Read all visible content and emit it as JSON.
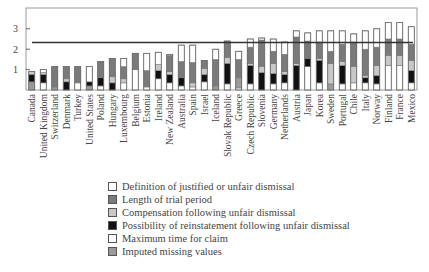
{
  "chart_data": {
    "type": "bar",
    "stacked": true,
    "title": "",
    "xlabel": "",
    "ylabel": "",
    "ylim": [
      0,
      4
    ],
    "yticks": [
      1,
      2,
      3
    ],
    "grid": false,
    "legend_position": "below",
    "reference_line": {
      "label": "OECD average",
      "value": 2.33
    },
    "categories": [
      "Canada",
      "United Kingdom",
      "Switzerland",
      "Denmark",
      "Turkey",
      "United States",
      "Poland",
      "Hungary",
      "Luxembourg",
      "Belgium",
      "Estonia",
      "Ireland",
      "New Zealand",
      "Australia",
      "Spain",
      "Israel",
      "Iceland",
      "Slovak Republic",
      "Greece",
      "Czech Republic",
      "Slovenia",
      "Germany",
      "Netherlands",
      "Austria",
      "Japan",
      "Korea",
      "Sweden",
      "Portugal",
      "Chile",
      "Italy",
      "Norway",
      "Finland",
      "France",
      "Mexico"
    ],
    "series": [
      {
        "name": "Maximum time for claim",
        "color": "#ffffff",
        "values": [
          0.0,
          0.35,
          0.0,
          0.0,
          0.35,
          0.0,
          0.2,
          0.0,
          0.35,
          1.0,
          0.15,
          0.55,
          0.35,
          0.2,
          0.15,
          0.4,
          0.0,
          0.3,
          0.1,
          0.3,
          0.0,
          0.3,
          0.35,
          0.0,
          1.15,
          0.35,
          0.0,
          0.3,
          0.35,
          0.35,
          0.3,
          1.2,
          1.2,
          0.35
        ]
      },
      {
        "name": "Imputed missing values",
        "color": "#9a9a9a",
        "values": [
          0.4,
          0.0,
          0.15,
          0.0,
          0.0,
          0.2,
          0.0,
          0.0,
          0.0,
          0.0,
          0.0,
          0.0,
          0.0,
          0.0,
          0.0,
          0.0,
          0.2,
          0.0,
          0.5,
          0.0,
          0.0,
          0.0,
          0.0,
          0.0,
          0.0,
          0.0,
          0.3,
          0.0,
          0.0,
          0.0,
          0.0,
          0.0,
          0.0,
          0.0
        ]
      },
      {
        "name": "Possibility of reinstatement following unfair dismissal",
        "color": "#111111",
        "values": [
          0.35,
          0.4,
          0.0,
          0.4,
          0.0,
          0.2,
          0.4,
          0.35,
          0.0,
          0.0,
          0.0,
          0.4,
          0.4,
          0.4,
          0.0,
          0.35,
          0.0,
          1.0,
          0.0,
          0.9,
          0.85,
          0.5,
          0.4,
          1.2,
          0.4,
          1.1,
          0.0,
          0.9,
          0.0,
          0.25,
          0.4,
          0.0,
          0.0,
          0.6
        ]
      },
      {
        "name": "Compensation following unfair dismissal",
        "color": "#c8c8c8",
        "values": [
          0.15,
          0.1,
          0.0,
          0.15,
          0.0,
          0.0,
          0.0,
          0.3,
          0.2,
          0.0,
          0.0,
          0.3,
          0.15,
          0.0,
          0.2,
          0.3,
          0.0,
          0.3,
          0.0,
          0.1,
          0.3,
          0.5,
          0.15,
          0.1,
          0.0,
          0.1,
          1.0,
          0.2,
          0.8,
          0.1,
          0.5,
          0.5,
          0.5,
          0.5
        ]
      },
      {
        "name": "Length of trial period",
        "color": "#7a7a7a",
        "values": [
          0.0,
          0.0,
          1.0,
          0.6,
          0.8,
          0.0,
          0.8,
          0.9,
          0.6,
          0.8,
          0.8,
          0.0,
          0.8,
          0.8,
          1.0,
          0.4,
          1.3,
          0.8,
          0.9,
          0.8,
          1.3,
          0.6,
          0.85,
          1.3,
          0.85,
          0.8,
          0.6,
          0.85,
          1.2,
          1.3,
          0.9,
          0.8,
          0.8,
          0.8
        ]
      },
      {
        "name": "Definition of justified or unfair dismissal",
        "color": "#ffffff",
        "values": [
          0.0,
          0.15,
          0.0,
          0.0,
          0.0,
          0.75,
          0.0,
          0.0,
          0.4,
          0.0,
          0.85,
          0.6,
          0.05,
          0.8,
          0.85,
          0.0,
          0.5,
          0.0,
          0.4,
          0.4,
          0.1,
          0.6,
          0.6,
          0.3,
          0.4,
          0.55,
          1.0,
          0.65,
          0.4,
          0.9,
          0.9,
          0.8,
          0.8,
          0.85
        ]
      }
    ],
    "totals": [
      0.9,
      1.0,
      1.15,
      1.15,
      1.15,
      1.15,
      1.4,
      1.55,
      1.55,
      1.8,
      1.8,
      1.85,
      1.75,
      2.2,
      2.2,
      1.45,
      2.0,
      2.4,
      1.9,
      2.5,
      2.55,
      2.5,
      2.35,
      2.9,
      2.8,
      2.9,
      2.9,
      2.9,
      2.75,
      2.9,
      3.0,
      3.3,
      3.3,
      3.1
    ]
  },
  "legend": {
    "items": [
      {
        "label": "Definition of justified or unfair dismissal",
        "color": "#ffffff"
      },
      {
        "label": "Length of trial period",
        "color": "#7a7a7a"
      },
      {
        "label": "Compensation following unfair dismissal",
        "color": "#c8c8c8"
      },
      {
        "label": "Possibility of reinstatement following unfair dismissal",
        "color": "#111111"
      },
      {
        "label": "Maximum time for claim",
        "color": "#ffffff"
      },
      {
        "label": "Imputed missing values",
        "color": "#9a9a9a"
      }
    ]
  }
}
